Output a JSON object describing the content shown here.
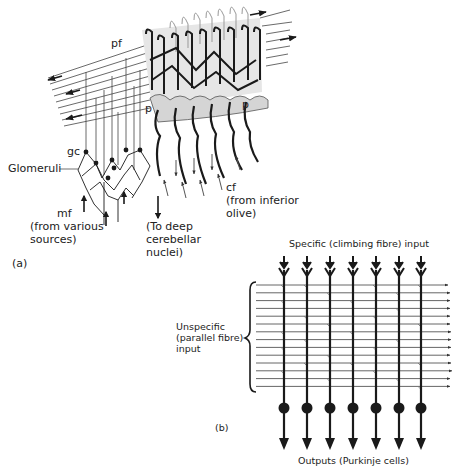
{
  "figure": {
    "panel_a": {
      "panel_label": "(a)",
      "labels": {
        "pf": "pf",
        "p_left": "p",
        "p_right": "p",
        "gc": "gc",
        "glomeruli": "Glomeruli",
        "mf_1": "mf",
        "mf_2": "(from various",
        "mf_3": "sources)",
        "deep_1": "(To deep",
        "deep_2": "cerebellar",
        "deep_3": "nuclei)",
        "cf_1": "cf",
        "cf_2": "(from inferior",
        "cf_3": "olive)"
      }
    },
    "panel_b": {
      "panel_label": "(b)",
      "top_label": "Specific (climbing fibre) input",
      "left_label_1": "Unspecific",
      "left_label_2": "(parallel fibre)",
      "left_label_3": "input",
      "bottom_label": "Outputs (Purkinje cells)",
      "climbing_fibre_count": 7,
      "parallel_fibre_count": 14
    },
    "colors": {
      "ink": "#1a1a1a",
      "stipple": "#d8d8d8",
      "background": "#ffffff"
    }
  }
}
